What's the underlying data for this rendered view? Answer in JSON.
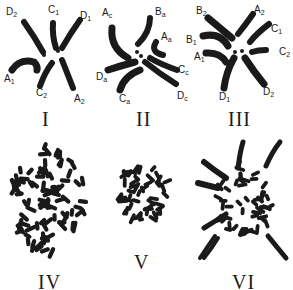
{
  "figure": {
    "ink_color": "#1a1a1a",
    "background_color": "#ffffff"
  },
  "panels": [
    {
      "numeral": "I",
      "labels": [
        {
          "base": "D",
          "sub": "2"
        },
        {
          "base": "C",
          "sub": "1"
        },
        {
          "base": "D",
          "sub": "1"
        },
        {
          "base": "A",
          "sub": "1"
        },
        {
          "base": "C",
          "sub": "2"
        },
        {
          "base": "A",
          "sub": "2"
        }
      ]
    },
    {
      "numeral": "II",
      "labels": [
        {
          "base": "A",
          "sub": "c"
        },
        {
          "base": "B",
          "sub": "a"
        },
        {
          "base": "A",
          "sub": "a"
        },
        {
          "base": "D",
          "sub": "a"
        },
        {
          "base": "C",
          "sub": "c"
        },
        {
          "base": "C",
          "sub": "a"
        },
        {
          "base": "D",
          "sub": "c"
        }
      ]
    },
    {
      "numeral": "III",
      "labels": [
        {
          "base": "B",
          "sub": "2"
        },
        {
          "base": "A",
          "sub": "2"
        },
        {
          "base": "C",
          "sub": "1"
        },
        {
          "base": "B",
          "sub": "1"
        },
        {
          "base": "A",
          "sub": "1"
        },
        {
          "base": "C",
          "sub": "2"
        },
        {
          "base": "D",
          "sub": "1"
        },
        {
          "base": "D",
          "sub": "2"
        }
      ]
    },
    {
      "numeral": "IV",
      "labels": []
    },
    {
      "numeral": "V",
      "labels": []
    },
    {
      "numeral": "VI",
      "labels": []
    }
  ]
}
